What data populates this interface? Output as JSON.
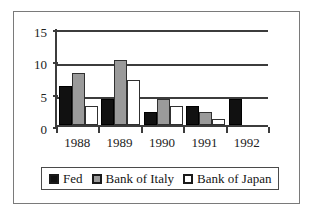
{
  "chart_data": {
    "type": "bar",
    "title": "",
    "xlabel": "",
    "ylabel": "",
    "categories": [
      "1988",
      "1989",
      "1990",
      "1991",
      "1992"
    ],
    "ylim": [
      0,
      15
    ],
    "yticks": [
      0,
      5,
      10,
      15
    ],
    "ytick_labels": [
      "0",
      "5",
      "10",
      "15"
    ],
    "grid": true,
    "legend_position": "bottom",
    "series": [
      {
        "name": "Fed",
        "color": "#111111",
        "values": [
          6,
          4,
          2,
          3,
          4
        ]
      },
      {
        "name": "Bank of Italy",
        "color": "#9a9a9a",
        "values": [
          8,
          10,
          4,
          2,
          0
        ]
      },
      {
        "name": "Bank of Japan",
        "color": "#ffffff",
        "values": [
          3,
          7,
          3,
          1,
          0
        ]
      }
    ]
  },
  "legend": {
    "entries": [
      {
        "label": "Fed"
      },
      {
        "label": "Bank of Italy"
      },
      {
        "label": "Bank of Japan"
      }
    ]
  }
}
